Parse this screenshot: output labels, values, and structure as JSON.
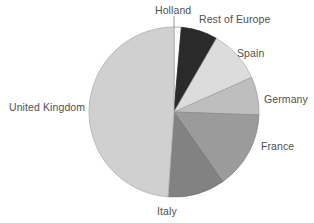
{
  "chart_data": {
    "type": "pie",
    "title": "",
    "subtitle": "",
    "xlabel": "",
    "ylabel": "",
    "legend_position": "none",
    "grid": false,
    "labels_outside": true,
    "total": 100,
    "categories": [
      "Holland",
      "Rest of Europe",
      "Spain",
      "Germany",
      "France",
      "Italy",
      "United Kingdom"
    ],
    "values": [
      1.4,
      7.0,
      10.0,
      7.2,
      14.7,
      10.8,
      48.9
    ],
    "slices": [
      {
        "label": "Holland",
        "value": 1.4,
        "start_angle": 0,
        "end_angle": 5,
        "color": "#fbfbfb",
        "stroke": "#9a9a9a"
      },
      {
        "label": "Rest of Europe",
        "value": 7.0,
        "start_angle": 5,
        "end_angle": 30,
        "color": "#2a2a2a",
        "stroke": "#2a2a2a"
      },
      {
        "label": "Spain",
        "value": 10.0,
        "start_angle": 30,
        "end_angle": 66,
        "color": "#dcdcdc",
        "stroke": "#b4b4b4"
      },
      {
        "label": "Germany",
        "value": 7.2,
        "start_angle": 66,
        "end_angle": 92,
        "color": "#bebebe",
        "stroke": "#a0a0a0"
      },
      {
        "label": "France",
        "value": 14.7,
        "start_angle": 92,
        "end_angle": 145,
        "color": "#9b9b9b",
        "stroke": "#8a8a8a"
      },
      {
        "label": "Italy",
        "value": 10.8,
        "start_angle": 145,
        "end_angle": 184,
        "color": "#828282",
        "stroke": "#767676"
      },
      {
        "label": "United Kingdom",
        "value": 48.9,
        "start_angle": 184,
        "end_angle": 360,
        "color": "#d0d0d0",
        "stroke": "#b0b0b0"
      }
    ]
  },
  "labels": {
    "holland": "Holland",
    "rest_of_europe": "Rest of Europe",
    "spain": "Spain",
    "germany": "Germany",
    "france": "France",
    "italy": "Italy",
    "united_kingdom": "United Kingdom"
  },
  "geometry": {
    "center_x": 174,
    "center_y": 112,
    "radius": 85
  },
  "colors": {
    "background": "#ffffff",
    "text": "#4f4f4f",
    "leader": "#8a8a8a"
  }
}
